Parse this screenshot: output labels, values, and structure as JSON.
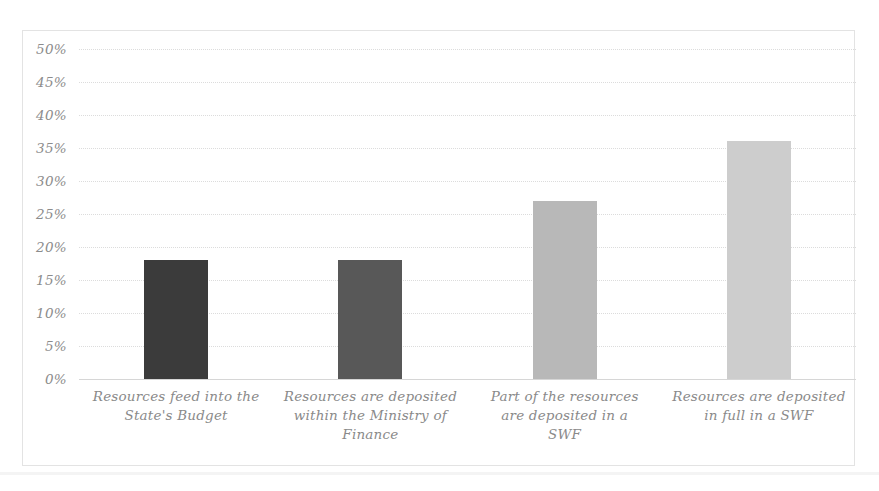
{
  "chart_data": {
    "type": "bar",
    "title": "",
    "subtitle": "",
    "xlabel": "",
    "ylabel": "",
    "categories": [
      "Resources feed into the State's Budget",
      "Resources are deposited within the Ministry of Finance",
      "Part of the resources are deposited in a SWF",
      "Resources are deposited in full in a SWF"
    ],
    "category_lines": [
      [
        "Resources feed into the",
        "State's Budget"
      ],
      [
        "Resources are deposited",
        "within the Ministry of",
        "Finance"
      ],
      [
        "Part of the resources",
        "are deposited in a",
        "SWF"
      ],
      [
        "Resources are deposited",
        "in full in a SWF"
      ]
    ],
    "values": [
      18,
      18,
      27,
      36
    ],
    "value_labels": [
      "18%",
      "18%",
      "27%",
      "36%"
    ],
    "bar_colors": [
      "#3b3b3b",
      "#585858",
      "#b8b8b8",
      "#cdcdcd"
    ],
    "ylim": [
      0,
      50
    ],
    "ytick_step": 5,
    "ytick_labels": [
      "50%",
      "45%",
      "40%",
      "35%",
      "30%",
      "25%",
      "20%",
      "15%",
      "10%",
      "5%",
      "0%"
    ],
    "ytick_values": [
      50,
      45,
      40,
      35,
      30,
      25,
      20,
      15,
      10,
      5,
      0
    ],
    "grid": true,
    "grid_axis": "y",
    "legend": false,
    "legend_position": "none"
  },
  "style": {
    "background": "#ffffff",
    "border_color": "#e3e3e3",
    "gridline_color": "#dcdcdc",
    "baseline_color": "#d6d6d6",
    "tick_text_color": "#8c8c8c",
    "label_text_color": "#8a8a8a"
  }
}
